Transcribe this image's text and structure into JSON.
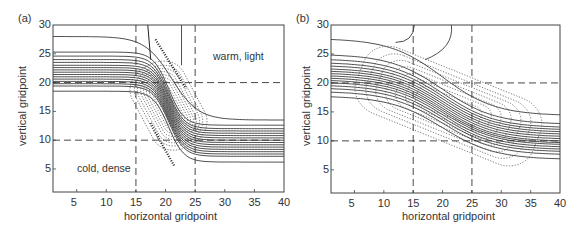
{
  "chart_data": [
    {
      "type": "line",
      "panel": "(a)",
      "title": "",
      "xlabel": "horizontal gridpoint",
      "ylabel": "vertical gridpoint",
      "xlim": [
        1,
        40
      ],
      "ylim": [
        1,
        30
      ],
      "xticks": [
        5,
        10,
        15,
        20,
        25,
        30,
        35,
        40
      ],
      "yticks": [
        5,
        10,
        15,
        20,
        25,
        30
      ],
      "grid": false,
      "reference_lines": {
        "dashed_x": [
          15,
          25
        ],
        "dashed_y": [
          10,
          20
        ]
      },
      "annotations": [
        {
          "text": "warm, light",
          "x": 32,
          "y": 24
        },
        {
          "text": "cold, dense",
          "x": 8,
          "y": 5
        }
      ],
      "series": [
        {
          "name": "solid isolines (density)",
          "style": "solid",
          "description": "near-horizontal contours ~18-28 on left (x<15) sloping steeply between x=15-25 down to ~6-13 on right (x>25)"
        },
        {
          "name": "dotted contours",
          "style": "dotted",
          "description": "closed elongated contours centered near (21,16), tilted along the front from x~13 to x~29"
        }
      ]
    },
    {
      "type": "line",
      "panel": "(b)",
      "title": "",
      "xlabel": "horizontal gridpoint",
      "ylabel": "vertical gridpoint",
      "xlim": [
        1,
        40
      ],
      "ylim": [
        1,
        30
      ],
      "xticks": [
        5,
        10,
        15,
        20,
        25,
        30,
        35,
        40
      ],
      "yticks": [
        5,
        10,
        15,
        20,
        25,
        30
      ],
      "grid": false,
      "reference_lines": {
        "dashed_x": [
          15,
          25
        ],
        "dashed_y": [
          10,
          20
        ]
      },
      "annotations": [],
      "series": [
        {
          "name": "solid isolines (density)",
          "style": "solid",
          "description": "contours ~17-27 on left gradually sloping to ~7-14 on right across whole domain"
        },
        {
          "name": "dotted contours",
          "style": "dotted",
          "description": "broad closed contours tilted along the sloping isolines, spanning x~5 to x~39"
        }
      ]
    }
  ],
  "panels": {
    "a": {
      "label": "(a)",
      "xlabel": "horizontal gridpoint",
      "ylabel": "vertical gridpoint",
      "xticks": [
        "5",
        "10",
        "15",
        "20",
        "25",
        "30",
        "35",
        "40"
      ],
      "yticks": [
        "5",
        "10",
        "15",
        "20",
        "25",
        "30"
      ],
      "annot_warm": "warm, light",
      "annot_cold": "cold, dense"
    },
    "b": {
      "label": "(b)",
      "xlabel": "horizontal gridpoint",
      "ylabel": "vertical gridpoint",
      "xticks": [
        "5",
        "10",
        "15",
        "20",
        "25",
        "30",
        "35",
        "40"
      ],
      "yticks": [
        "5",
        "10",
        "15",
        "20",
        "25",
        "30"
      ]
    }
  }
}
